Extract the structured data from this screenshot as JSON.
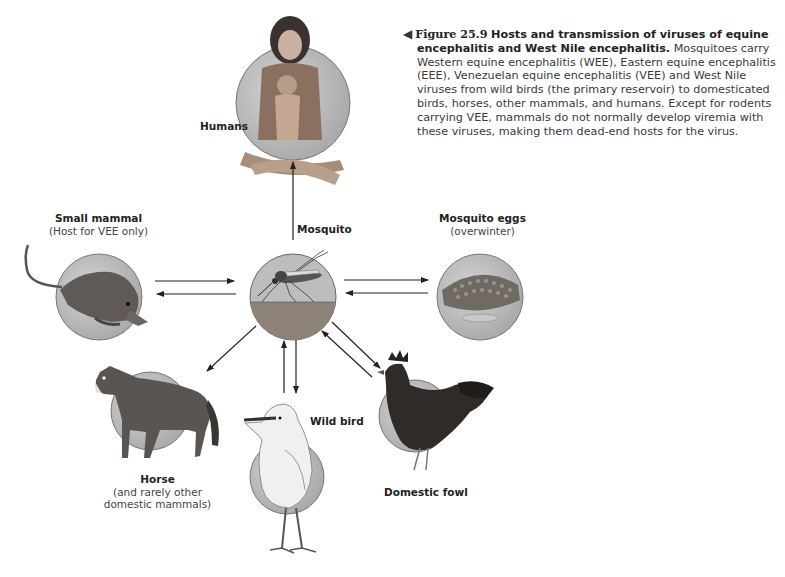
{
  "caption": {
    "figure_number": "Figure 25.9",
    "title": "Hosts and transmission of viruses of equine encephalitis and West Nile encephalitis.",
    "body": "Mosquitoes carry Western equine encephalitis (WEE), Eastern equine encephalitis (EEE), Venezuelan equine encephalitis (VEE) and West Nile viruses from wild birds (the primary reservoir) to domesticated birds, horses, other mammals, and humans. Except for rodents carrying VEE, mammals do not normally develop viremia with these viruses, making them dead-end hosts for the virus."
  },
  "nodes": {
    "humans": {
      "name": "Humans",
      "sub": ""
    },
    "mosquito": {
      "name": "Mosquito",
      "sub": ""
    },
    "small_mammal": {
      "name": "Small mammal",
      "sub": "(Host for VEE only)"
    },
    "mosquito_eggs": {
      "name": "Mosquito eggs",
      "sub": "(overwinter)"
    },
    "horse": {
      "name": "Horse",
      "sub1": "(and rarely other",
      "sub2": "domestic mammals)"
    },
    "wild_bird": {
      "name": "Wild bird",
      "sub": ""
    },
    "domestic_fowl": {
      "name": "Domestic fowl",
      "sub": ""
    }
  },
  "edges": [
    {
      "from": "Mosquito",
      "to": "Humans"
    },
    {
      "from": "Mosquito",
      "to": "Small mammal"
    },
    {
      "from": "Small mammal",
      "to": "Mosquito"
    },
    {
      "from": "Mosquito",
      "to": "Mosquito eggs"
    },
    {
      "from": "Mosquito eggs",
      "to": "Mosquito"
    },
    {
      "from": "Mosquito",
      "to": "Horse"
    },
    {
      "from": "Wild bird",
      "to": "Mosquito"
    },
    {
      "from": "Mosquito",
      "to": "Wild bird"
    },
    {
      "from": "Mosquito",
      "to": "Domestic fowl"
    },
    {
      "from": "Domestic fowl",
      "to": "Mosquito"
    }
  ],
  "colors": {
    "circle_fill": "#b9b9b9",
    "circle_stroke": "#6e6e6e",
    "arrow": "#222222",
    "text": "#222222"
  }
}
